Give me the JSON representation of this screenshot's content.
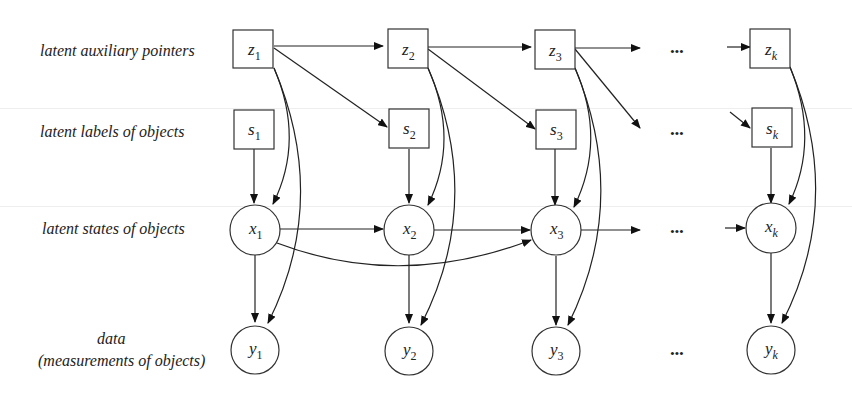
{
  "figure": {
    "type": "graphical-model",
    "rows": [
      {
        "id": "z",
        "label": "latent auxiliary pointers",
        "shape": "square"
      },
      {
        "id": "s",
        "label": "latent labels of objects",
        "shape": "square"
      },
      {
        "id": "x",
        "label": "latent states of objects",
        "shape": "circle"
      },
      {
        "id": "y",
        "label_line1": "data",
        "label_line2": "(measurements of objects)",
        "shape": "circle"
      }
    ],
    "columns": [
      "1",
      "2",
      "3",
      "k"
    ],
    "ellipsis": "•••",
    "nodes": {
      "z": [
        {
          "base": "z",
          "sub": "1"
        },
        {
          "base": "z",
          "sub": "2"
        },
        {
          "base": "z",
          "sub": "3"
        },
        {
          "base": "z",
          "sub": "k"
        }
      ],
      "s": [
        {
          "base": "s",
          "sub": "1"
        },
        {
          "base": "s",
          "sub": "2"
        },
        {
          "base": "s",
          "sub": "3"
        },
        {
          "base": "s",
          "sub": "k"
        }
      ],
      "x": [
        {
          "base": "x",
          "sub": "1"
        },
        {
          "base": "x",
          "sub": "2"
        },
        {
          "base": "x",
          "sub": "3"
        },
        {
          "base": "x",
          "sub": "k"
        }
      ],
      "y": [
        {
          "base": "y",
          "sub": "1"
        },
        {
          "base": "y",
          "sub": "2"
        },
        {
          "base": "y",
          "sub": "3"
        },
        {
          "base": "y",
          "sub": "k"
        }
      ]
    },
    "edges": [
      "z1->z2",
      "z2->z3",
      "z3->...",
      "...->zk",
      "z1->s2",
      "z2->s3",
      "z3->...",
      "...->sk",
      "s1->x1",
      "s2->x2",
      "s3->x3",
      "sk->xk",
      "z1->x1",
      "z2->x2",
      "z3->x3",
      "zk->xk",
      "z1->y1",
      "z2->y2",
      "z3->y3",
      "zk->yk",
      "x1->x2",
      "x2->x3",
      "x3->...",
      "...->xk",
      "x1->x3",
      "x1->y1",
      "x2->y2",
      "x3->y3",
      "xk->yk"
    ]
  }
}
